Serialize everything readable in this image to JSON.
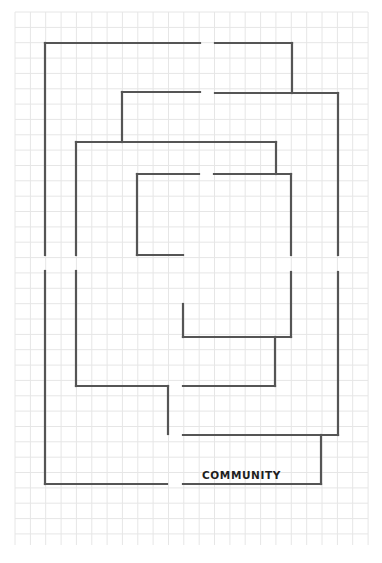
{
  "diagram": {
    "type": "maze-floorplan",
    "label": "COMMUNITY",
    "colors": {
      "background": "#ffffff",
      "grid": "#e6e6e6",
      "lines": "#555555",
      "text": "#1e1e1e"
    },
    "grid": {
      "x_start": 15,
      "x_end": 368,
      "y_start": 12,
      "y_end": 545,
      "spacing": 15.35
    },
    "segments": [
      {
        "x1": 45,
        "y1": 43,
        "x2": 200,
        "y2": 43
      },
      {
        "x1": 215,
        "y1": 43,
        "x2": 292,
        "y2": 43
      },
      {
        "x1": 292,
        "y1": 43,
        "x2": 292,
        "y2": 93
      },
      {
        "x1": 45,
        "y1": 43,
        "x2": 45,
        "y2": 255
      },
      {
        "x1": 45,
        "y1": 271,
        "x2": 45,
        "y2": 484
      },
      {
        "x1": 45,
        "y1": 484,
        "x2": 167,
        "y2": 484
      },
      {
        "x1": 183,
        "y1": 484,
        "x2": 321,
        "y2": 484
      },
      {
        "x1": 321,
        "y1": 435,
        "x2": 321,
        "y2": 484
      },
      {
        "x1": 122,
        "y1": 92,
        "x2": 200,
        "y2": 92
      },
      {
        "x1": 215,
        "y1": 93,
        "x2": 338,
        "y2": 93
      },
      {
        "x1": 122,
        "y1": 92,
        "x2": 122,
        "y2": 142
      },
      {
        "x1": 338,
        "y1": 93,
        "x2": 338,
        "y2": 255
      },
      {
        "x1": 338,
        "y1": 272,
        "x2": 338,
        "y2": 435
      },
      {
        "x1": 183,
        "y1": 435,
        "x2": 338,
        "y2": 435
      },
      {
        "x1": 76,
        "y1": 142,
        "x2": 276,
        "y2": 142
      },
      {
        "x1": 276,
        "y1": 142,
        "x2": 276,
        "y2": 174
      },
      {
        "x1": 76,
        "y1": 142,
        "x2": 76,
        "y2": 255
      },
      {
        "x1": 76,
        "y1": 271,
        "x2": 76,
        "y2": 386
      },
      {
        "x1": 76,
        "y1": 386,
        "x2": 168,
        "y2": 386
      },
      {
        "x1": 168,
        "y1": 386,
        "x2": 168,
        "y2": 434
      },
      {
        "x1": 183,
        "y1": 386,
        "x2": 275,
        "y2": 386
      },
      {
        "x1": 275,
        "y1": 337,
        "x2": 275,
        "y2": 386
      },
      {
        "x1": 137,
        "y1": 174,
        "x2": 199,
        "y2": 174
      },
      {
        "x1": 214,
        "y1": 174,
        "x2": 291,
        "y2": 174
      },
      {
        "x1": 137,
        "y1": 174,
        "x2": 137,
        "y2": 255
      },
      {
        "x1": 137,
        "y1": 255,
        "x2": 183,
        "y2": 255
      },
      {
        "x1": 291,
        "y1": 174,
        "x2": 291,
        "y2": 255
      },
      {
        "x1": 291,
        "y1": 272,
        "x2": 291,
        "y2": 337
      },
      {
        "x1": 183,
        "y1": 304,
        "x2": 183,
        "y2": 337
      },
      {
        "x1": 183,
        "y1": 337,
        "x2": 291,
        "y2": 337
      }
    ],
    "label_position": {
      "x": 202,
      "y": 479
    }
  }
}
